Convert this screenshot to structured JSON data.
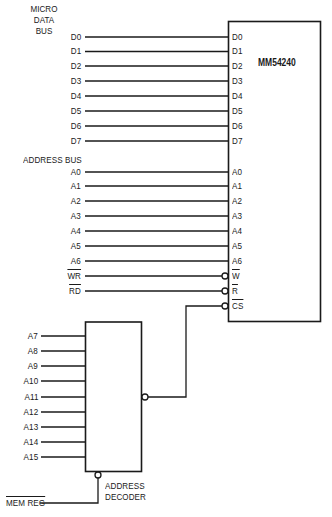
{
  "diagram": {
    "data_bus": {
      "heading_lines": [
        "MICRO",
        "DATA",
        "BUS"
      ],
      "signals": [
        "D0",
        "D1",
        "D2",
        "D3",
        "D4",
        "D5",
        "D6",
        "D7"
      ]
    },
    "address_bus": {
      "heading": "ADDRESS BUS",
      "signals": [
        "A0",
        "A1",
        "A2",
        "A3",
        "A4",
        "A5",
        "A6"
      ]
    },
    "control_signals": [
      {
        "source": "WR",
        "pin": "W",
        "active_low": true
      },
      {
        "source": "RD",
        "pin": "R",
        "active_low": true
      }
    ],
    "chip": {
      "name": "MM54240",
      "data_pins": [
        "D0",
        "D1",
        "D2",
        "D3",
        "D4",
        "D5",
        "D6",
        "D7"
      ],
      "address_pins": [
        "A0",
        "A1",
        "A2",
        "A3",
        "A4",
        "A5",
        "A6"
      ],
      "control_pins": [
        "W",
        "R",
        "CS"
      ]
    },
    "decoder": {
      "label_lines": [
        "ADDRESS",
        "DECODER"
      ],
      "inputs": [
        "A7",
        "A8",
        "A9",
        "A10",
        "A11",
        "A12",
        "A13",
        "A14",
        "A15"
      ],
      "enable_input": "MEM REG"
    },
    "colors": {
      "line": "#1a1a1a",
      "background": "#ffffff"
    }
  }
}
